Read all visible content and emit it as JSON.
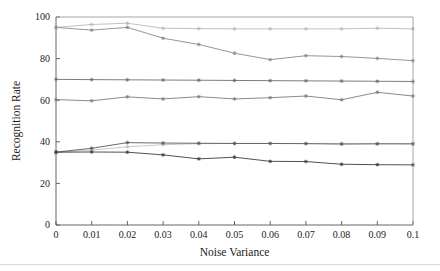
{
  "figure": {
    "name": "recognition-rate-vs-noise-variance",
    "background": "#ffffff"
  },
  "chart_data": {
    "type": "line",
    "title": "",
    "subtitle": "",
    "xlabel": "Noise Variance",
    "ylabel": "Recognition Rate",
    "xlim": [
      0,
      0.1
    ],
    "ylim": [
      0,
      100
    ],
    "grid": false,
    "legend": "none",
    "x": [
      0,
      0.01,
      0.02,
      0.03,
      0.04,
      0.05,
      0.06,
      0.07,
      0.08,
      0.09,
      0.1
    ],
    "xtick_labels": [
      "0",
      "0.01",
      "0.02",
      "0.03",
      "0.04",
      "0.05",
      "0.06",
      "0.07",
      "0.08",
      "0.09",
      "0.1"
    ],
    "ytick_labels": [
      "0",
      "20",
      "40",
      "60",
      "80",
      "100"
    ],
    "ytick_values": [
      0,
      20,
      40,
      60,
      80,
      100
    ],
    "marker": "asterisk",
    "series": [
      {
        "name": "series-top-flat",
        "color": "#b9b9b9",
        "values": [
          95.0,
          96.4,
          97.0,
          94.6,
          94.4,
          94.3,
          94.3,
          94.3,
          94.3,
          94.6,
          94.3
        ]
      },
      {
        "name": "series-top-declining",
        "color": "#8a8a8a",
        "values": [
          95.0,
          93.7,
          95.0,
          89.8,
          86.8,
          82.6,
          79.5,
          81.4,
          81.0,
          80.1,
          79.0
        ]
      },
      {
        "name": "series-mid-flat",
        "color": "#6e6e6e",
        "values": [
          70.0,
          69.9,
          69.8,
          69.7,
          69.6,
          69.5,
          69.4,
          69.3,
          69.2,
          69.1,
          69.0
        ]
      },
      {
        "name": "series-mid-wavy",
        "color": "#7d7d7d",
        "values": [
          60.3,
          59.7,
          61.6,
          60.6,
          61.7,
          60.6,
          61.2,
          62.0,
          60.2,
          63.8,
          62.0
        ]
      },
      {
        "name": "series-low-flat",
        "color": "#c2c2c2",
        "values": [
          35.0,
          36.0,
          37.6,
          38.6,
          39.1,
          39.2,
          39.2,
          39.2,
          39.2,
          39.2,
          39.1
        ]
      },
      {
        "name": "series-low-rising",
        "color": "#5a5a5a",
        "values": [
          35.0,
          36.9,
          39.6,
          39.4,
          39.3,
          39.2,
          39.2,
          39.1,
          38.9,
          39.0,
          39.0
        ]
      },
      {
        "name": "series-low-declining",
        "color": "#3d3d3d",
        "values": [
          35.0,
          35.1,
          35.0,
          33.7,
          31.8,
          32.6,
          30.6,
          30.5,
          29.2,
          29.0,
          28.9
        ]
      }
    ]
  },
  "axes": {
    "x_label": "Noise Variance",
    "y_label": "Recognition Rate"
  }
}
